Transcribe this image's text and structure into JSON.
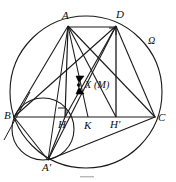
{
  "figure": {
    "kind": "geometry-diagram",
    "width": 176,
    "height": 182,
    "stroke_color": "#1a1a1a",
    "fill_color": "#000000",
    "background": "#ffffff"
  },
  "labels": {
    "A": "A",
    "D": "D",
    "Omega": "Ω",
    "X_M": "X (M)",
    "B": "B",
    "H": "H",
    "K": "K",
    "H_prime": "H'",
    "C": "C",
    "A_prime": "A'"
  },
  "points": {
    "A": {
      "x": 68,
      "y": 26
    },
    "D": {
      "x": 116,
      "y": 26
    },
    "B": {
      "x": 14,
      "y": 117
    },
    "C": {
      "x": 155,
      "y": 117
    },
    "H": {
      "x": 65,
      "y": 117
    },
    "K": {
      "x": 88,
      "y": 117
    },
    "H_prime": {
      "x": 116,
      "y": 117
    },
    "A_prime": {
      "x": 48,
      "y": 160
    },
    "X": {
      "x": 82,
      "y": 85
    }
  },
  "circles": {
    "circumcircle": {
      "cx": 86,
      "cy": 92,
      "r": 76,
      "label": "Ω"
    },
    "small_circle": {
      "cx": 43,
      "cy": 129,
      "r": 31
    }
  },
  "right_angle_marks": [
    {
      "at": "H",
      "x": 60,
      "y": 106
    },
    {
      "at": "D",
      "x": 110,
      "y": 28
    }
  ]
}
